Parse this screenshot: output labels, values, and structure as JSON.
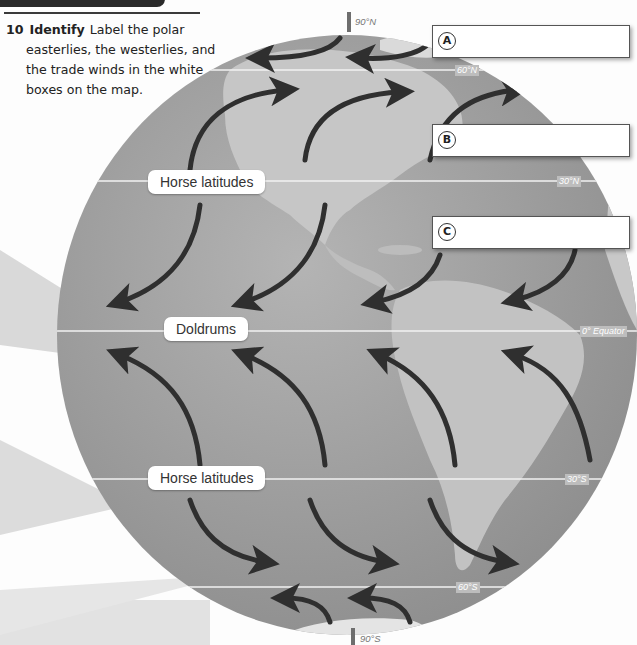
{
  "question": {
    "number": "10",
    "verb": "Identify",
    "lines": [
      "Label the polar",
      "easterlies, the westerlies, and",
      "the trade winds in the white",
      "boxes on the map."
    ]
  },
  "poles": {
    "north": "90°N",
    "south": "90°S"
  },
  "latitudes": {
    "n60": "60°N",
    "n30": "30°N",
    "equator": "0° Equator",
    "s30": "30°S",
    "s60": "60°S"
  },
  "zones": {
    "horse_north": "Horse latitudes",
    "doldrums": "Doldrums",
    "horse_south": "Horse latitudes"
  },
  "answer_boxes": [
    {
      "letter": "A",
      "value": ""
    },
    {
      "letter": "B",
      "value": ""
    },
    {
      "letter": "C",
      "value": ""
    }
  ],
  "colors": {
    "ocean": "#9a9a9a",
    "land": "#c4c4c4",
    "arrow": "#2f2f2f",
    "lat_line": "#f2f2f2"
  }
}
